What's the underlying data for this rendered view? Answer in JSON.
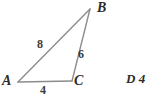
{
  "figure": {
    "type": "triangle-diagram",
    "stroke_color": "#8c8c8c",
    "text_color": "#2b2b2b",
    "background": "#ffffff",
    "vertices": [
      {
        "name": "A",
        "label": "A",
        "x": 18,
        "y": 82
      },
      {
        "name": "B",
        "label": "B",
        "x": 90,
        "y": 9
      },
      {
        "name": "C",
        "label": "C",
        "x": 72,
        "y": 81
      }
    ],
    "sides": [
      {
        "name": "AB",
        "label": "8",
        "from": "A",
        "to": "B"
      },
      {
        "name": "BC",
        "label": "6",
        "from": "B",
        "to": "C"
      },
      {
        "name": "AC",
        "label": "4",
        "from": "A",
        "to": "C"
      }
    ]
  },
  "answer_choice": {
    "label": "D 4"
  }
}
